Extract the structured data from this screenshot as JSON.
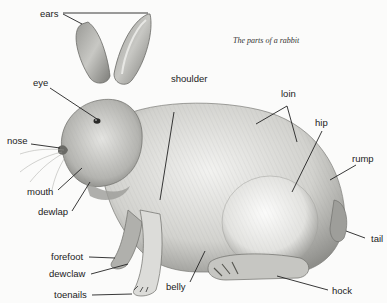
{
  "caption": "The parts of a rabbit",
  "labels": {
    "ears": "ears",
    "eye": "eye",
    "nose": "nose",
    "mouth": "mouth",
    "dewlap": "dewlap",
    "shoulder": "shoulder",
    "loin": "loin",
    "hip": "hip",
    "rump": "rump",
    "tail": "tail",
    "hock": "hock",
    "belly": "belly",
    "forefoot": "forefoot",
    "dewclaw": "dewclaw",
    "toenails": "toenails"
  },
  "colors": {
    "background": "#fbfbfa",
    "fur_light": "#e6e6e3",
    "fur_mid": "#b9b9b5",
    "fur_dark": "#6e6e6a",
    "leader_line": "#222222"
  }
}
